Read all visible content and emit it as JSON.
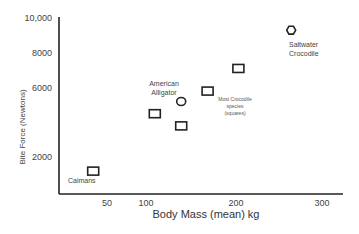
{
  "chart_data": {
    "type": "scatter",
    "title": "",
    "xlabel": "Body Mass (mean) kg",
    "ylabel": "Bite Force (Newtons)",
    "xlim": [
      0,
      330
    ],
    "ylim": [
      0,
      10000
    ],
    "x_ticks": [
      {
        "value": 50,
        "label": "50"
      },
      {
        "value": 100,
        "label": "100"
      },
      {
        "value": 200,
        "label": "200"
      },
      {
        "value": 300,
        "label": "300"
      }
    ],
    "y_ticks": [
      {
        "value": 2000,
        "label": "2000"
      },
      {
        "value": 6000,
        "label": "6000"
      },
      {
        "value": 8000,
        "label": "8000"
      },
      {
        "value": 10000,
        "label": "10,000"
      }
    ],
    "grid": false,
    "legend": null,
    "points": [
      {
        "name": "Caimans",
        "x": 40,
        "y": 1200,
        "marker": "square"
      },
      {
        "name": "Crocodile species A",
        "x": 110,
        "y": 4500,
        "marker": "square"
      },
      {
        "name": "American Alligator",
        "x": 140,
        "y": 5200,
        "marker": "circle"
      },
      {
        "name": "Crocodile species B",
        "x": 140,
        "y": 3800,
        "marker": "square"
      },
      {
        "name": "Crocodile species C",
        "x": 170,
        "y": 5800,
        "marker": "square"
      },
      {
        "name": "Crocodile species D",
        "x": 205,
        "y": 7100,
        "marker": "square"
      },
      {
        "name": "Saltwater Crocodile",
        "x": 265,
        "y": 9300,
        "marker": "hexagon"
      }
    ],
    "annotations": [
      {
        "id": "caimans",
        "lines": [
          "Caimans"
        ]
      },
      {
        "id": "alligator",
        "lines": [
          "American",
          "Alligator"
        ]
      },
      {
        "id": "most-croc",
        "lines": [
          "Most Crocodile",
          "species",
          "(squares)"
        ]
      },
      {
        "id": "saltwater",
        "lines": [
          "Saltwater",
          "Crocodile"
        ]
      }
    ]
  }
}
